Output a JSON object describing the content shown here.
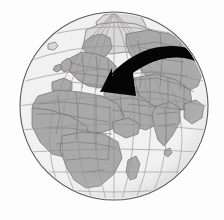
{
  "figure": {
    "name": "world-globe-with-movement-arrow",
    "description": "Grayscale orthographic globe centered on Africa, Europe and western Asia, overlaid with a thick black curved arrow sweeping from Central Asia westward to the Black Sea / Caucasus region",
    "projection": "orthographic",
    "width": 224,
    "height": 220
  },
  "colors": {
    "background": "#fdfdfd",
    "ocean": "#f1f1f1",
    "land": "#a9a9a9",
    "land_highlight": "#d8d8d8",
    "border": "#6e6e6e",
    "outline": "#5a5a5a",
    "graticule": "#9a8f8f",
    "arrow": "#050505",
    "shadow": "#e2e2e2"
  },
  "globe": {
    "center_x": 114,
    "center_y": 106,
    "radius": 94,
    "graticule": {
      "visible": true,
      "meridian_spacing_deg": 20,
      "parallel_spacing_deg": 20,
      "meridian_count": 9,
      "parallel_count": 8
    },
    "center_lon_deg": 22,
    "center_lat_deg": 22
  },
  "arrow": {
    "visible": true,
    "color": "#050505",
    "style": "thick-curved-tapered",
    "direction": "east-to-west",
    "tail_point": {
      "x": 196,
      "y": 52
    },
    "head_point": {
      "x": 110,
      "y": 90
    },
    "label": "migration-arrow"
  },
  "landmasses": [
    {
      "name": "africa"
    },
    {
      "name": "europe"
    },
    {
      "name": "asia"
    },
    {
      "name": "middle-east"
    },
    {
      "name": "india"
    },
    {
      "name": "greenland"
    },
    {
      "name": "arctic"
    },
    {
      "name": "madagascar"
    },
    {
      "name": "sri-lanka"
    },
    {
      "name": "iceland"
    },
    {
      "name": "british-isles"
    },
    {
      "name": "scandinavia"
    }
  ]
}
